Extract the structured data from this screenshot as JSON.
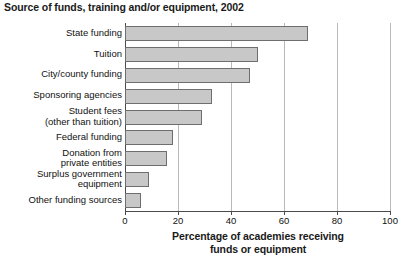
{
  "chart_data": {
    "type": "bar",
    "orientation": "horizontal",
    "title": "Source of funds, training and/or equipment, 2002",
    "xlabel_line1": "Percentage of academies receiving",
    "xlabel_line2": "funds or equipment",
    "ylabel": "",
    "xlim": [
      0,
      100
    ],
    "xticks": [
      0,
      20,
      40,
      60,
      80,
      100
    ],
    "xtick_labels": [
      "0",
      "20",
      "40",
      "60",
      "80",
      "100"
    ],
    "grid": "vertical",
    "legend": "none",
    "bar_color": "#c8c8c8",
    "bar_border_color": "#6e6e6e",
    "gridline_color": "#b9b9b9",
    "axis_color": "#4a4a4a",
    "categories": [
      "State funding",
      "Tuition",
      "City/county funding",
      "Sponsoring agencies",
      "Student fees\n(other than tuition)",
      "Federal funding",
      "Donation from\nprivate entities",
      "Surplus government\nequipment",
      "Other funding sources"
    ],
    "values": [
      69,
      50,
      47,
      33,
      29,
      18,
      16,
      9,
      6
    ]
  }
}
